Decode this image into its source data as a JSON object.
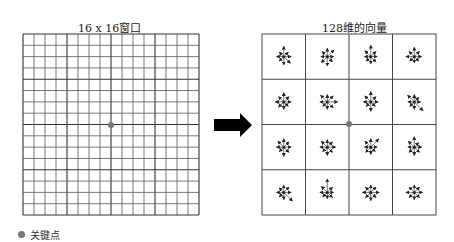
{
  "left_panel": {
    "title": "16 x 16窗口",
    "grid": {
      "cells": 16,
      "x": 23,
      "y": 34,
      "width": 176,
      "height": 181,
      "major_every": 4
    },
    "keypoint": {
      "x": 111,
      "y": 125
    }
  },
  "arrow": {
    "direction": "right",
    "color": "#000000"
  },
  "right_panel": {
    "title": "128维的向量",
    "grid": {
      "rows": 4,
      "cols": 4,
      "x": 262,
      "y": 34,
      "width": 174,
      "height": 181
    },
    "keypoint": {
      "x": 349,
      "y": 124
    },
    "cells": [
      [
        [
          10,
          6,
          7,
          9,
          8,
          6,
          7,
          6
        ],
        [
          8,
          9,
          6,
          7,
          9,
          8,
          6,
          7
        ],
        [
          11,
          7,
          6,
          7,
          7,
          6,
          6,
          8
        ],
        [
          9,
          7,
          7,
          6,
          6,
          6,
          8,
          7
        ]
      ],
      [
        [
          9,
          7,
          7,
          6,
          7,
          7,
          8,
          7
        ],
        [
          7,
          8,
          10,
          8,
          7,
          6,
          7,
          9
        ],
        [
          10,
          7,
          7,
          6,
          9,
          6,
          7,
          8
        ],
        [
          7,
          6,
          6,
          12,
          7,
          6,
          6,
          9
        ]
      ],
      [
        [
          8,
          7,
          7,
          7,
          9,
          6,
          7,
          8
        ],
        [
          7,
          7,
          8,
          7,
          8,
          6,
          7,
          8
        ],
        [
          8,
          11,
          6,
          6,
          7,
          7,
          6,
          8
        ],
        [
          10,
          6,
          7,
          7,
          8,
          7,
          6,
          8
        ]
      ],
      [
        [
          7,
          7,
          7,
          12,
          7,
          6,
          7,
          6
        ],
        [
          13,
          7,
          6,
          7,
          6,
          6,
          7,
          8
        ],
        [
          7,
          7,
          8,
          7,
          8,
          7,
          8,
          7
        ],
        [
          7,
          7,
          8,
          7,
          7,
          7,
          8,
          7
        ]
      ]
    ]
  },
  "legend": {
    "label": "关键点",
    "color": "#777777"
  }
}
